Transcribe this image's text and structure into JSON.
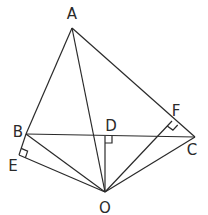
{
  "diagram": {
    "type": "geometry",
    "points": {
      "A": {
        "label": "A",
        "x": 72,
        "y": 28,
        "lx": 72,
        "ly": 19
      },
      "B": {
        "label": "B",
        "x": 26,
        "y": 134,
        "lx": 18,
        "ly": 137
      },
      "C": {
        "label": "C",
        "x": 195,
        "y": 137,
        "lx": 192,
        "ly": 155
      },
      "D": {
        "label": "D",
        "x": 105,
        "y": 136,
        "lx": 111,
        "ly": 131
      },
      "E": {
        "label": "E",
        "x": 19,
        "y": 155,
        "lx": 13,
        "ly": 171
      },
      "F": {
        "label": "F",
        "x": 172,
        "y": 121,
        "lx": 176,
        "ly": 116
      },
      "O": {
        "label": "O",
        "x": 105,
        "y": 192,
        "lx": 105,
        "ly": 213
      }
    },
    "segments": [
      [
        "A",
        "B"
      ],
      [
        "A",
        "C"
      ],
      [
        "A",
        "O"
      ],
      [
        "B",
        "C"
      ],
      [
        "B",
        "O"
      ],
      [
        "B",
        "E"
      ],
      [
        "E",
        "O"
      ],
      [
        "C",
        "O"
      ],
      [
        "D",
        "O"
      ],
      [
        "F",
        "O"
      ]
    ],
    "right_angles": [
      {
        "at": "E",
        "label": "right-angle-E"
      },
      {
        "at": "D",
        "label": "right-angle-D"
      },
      {
        "at": "F",
        "label": "right-angle-F"
      }
    ],
    "color": "#2a2a2a"
  }
}
